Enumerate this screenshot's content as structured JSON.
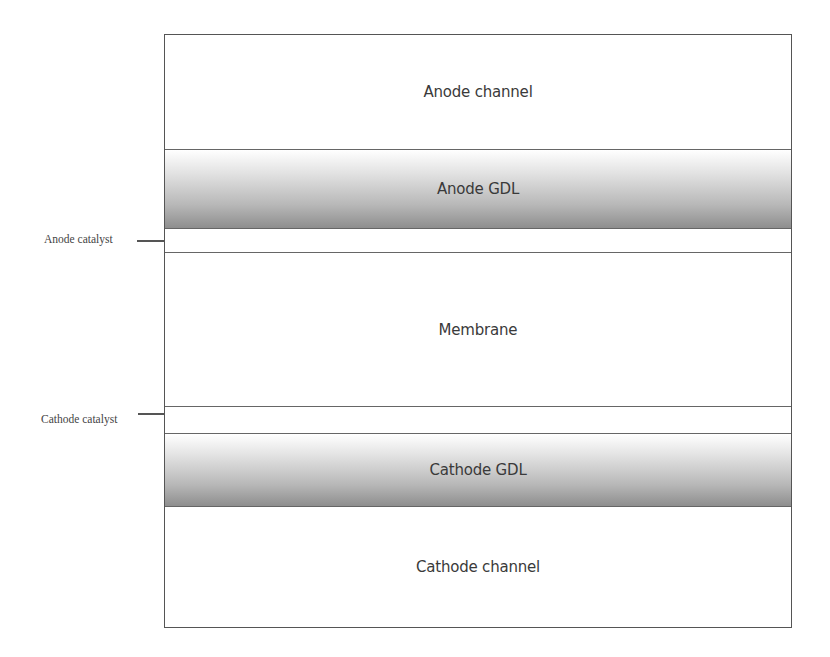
{
  "diagram": {
    "type": "layered-cross-section",
    "layers": [
      {
        "label": "Anode channel"
      },
      {
        "label": "Anode GDL"
      },
      {
        "label": ""
      },
      {
        "label": "Membrane"
      },
      {
        "label": ""
      },
      {
        "label": "Cathode GDL"
      },
      {
        "label": "Cathode channel"
      }
    ],
    "callouts": {
      "anode_catalyst": "Anode catalyst",
      "cathode_catalyst": "Cathode catalyst"
    }
  }
}
